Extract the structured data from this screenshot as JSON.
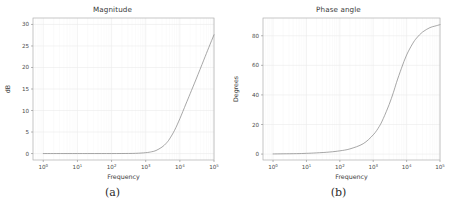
{
  "figure": {
    "caption_a": "(a)",
    "caption_b": "(b)"
  },
  "chart_data": [
    {
      "type": "line",
      "title": "Magnitude",
      "xlabel": "Frequency",
      "ylabel": "dB",
      "xscale": "log",
      "yscale": "linear",
      "xlim": [
        0.5,
        100000
      ],
      "ylim": [
        -1.5,
        31.5
      ],
      "grid": true,
      "legend": "none",
      "line_color": "#8a8a8a",
      "xticks": [
        1,
        10,
        100,
        1000,
        10000,
        100000
      ],
      "xtick_labels": [
        "10^0",
        "10^1",
        "10^2",
        "10^3",
        "10^4",
        "10^5"
      ],
      "yticks": [
        0,
        5,
        10,
        15,
        20,
        25,
        30
      ],
      "ytick_labels": [
        "0",
        "5",
        "10",
        "15",
        "20",
        "25",
        "30"
      ],
      "x": [
        1,
        2,
        5,
        10,
        20,
        50,
        100,
        200,
        500,
        1000,
        1500,
        2000,
        3000,
        4000,
        5000,
        7000,
        10000,
        15000,
        20000,
        30000,
        50000,
        70000,
        100000
      ],
      "values": [
        0.0,
        0.0,
        0.0,
        0.0,
        0.0,
        0.0,
        0.0,
        0.01,
        0.05,
        0.2,
        0.42,
        0.7,
        1.5,
        2.4,
        3.4,
        5.4,
        8.1,
        11.5,
        13.9,
        17.3,
        21.7,
        24.6,
        27.6
      ],
      "notes": "High-pass / differentiator magnitude response rising at 20 dB/decade above the corner near 1 kHz, reaching about 30 dB at 1e5 Hz."
    },
    {
      "type": "line",
      "title": "Phase angle",
      "xlabel": "Frequency",
      "ylabel": "Degrees",
      "xscale": "log",
      "yscale": "linear",
      "xlim": [
        0.5,
        100000
      ],
      "ylim": [
        -4,
        92
      ],
      "grid": true,
      "legend": "none",
      "line_color": "#8a8a8a",
      "xticks": [
        1,
        10,
        100,
        1000,
        10000,
        100000
      ],
      "xtick_labels": [
        "10^0",
        "10^1",
        "10^2",
        "10^3",
        "10^4",
        "10^5"
      ],
      "yticks": [
        0,
        20,
        40,
        60,
        80
      ],
      "ytick_labels": [
        "0",
        "20",
        "40",
        "60",
        "80"
      ],
      "x": [
        1,
        2,
        5,
        10,
        20,
        50,
        100,
        200,
        500,
        1000,
        1500,
        2000,
        3000,
        4000,
        5000,
        7000,
        10000,
        15000,
        20000,
        30000,
        50000,
        70000,
        100000
      ],
      "values": [
        0.1,
        0.2,
        0.3,
        0.5,
        0.8,
        1.4,
        2.2,
        3.5,
        7.0,
        13.0,
        18.5,
        24.0,
        33.5,
        41.5,
        48.5,
        58.0,
        67.0,
        74.5,
        78.5,
        82.5,
        85.5,
        86.5,
        87.5
      ],
      "notes": "Phase rises monotonically from about 0 degrees at low frequency through roughly 45 degrees near 4 kHz, asymptoting toward 90 degrees (about 88 degrees at 1e5 Hz)."
    }
  ]
}
